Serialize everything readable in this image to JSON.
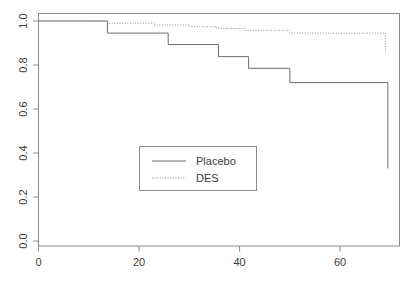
{
  "chart_data": {
    "type": "line",
    "subtype": "kaplan-meier-step",
    "title": "",
    "subtitle": "",
    "xlabel": "",
    "ylabel": "",
    "xlim": [
      0,
      72
    ],
    "ylim": [
      0.0,
      1.05
    ],
    "x_ticks": [
      0,
      20,
      40,
      60
    ],
    "x_tick_labels": [
      "0",
      "20",
      "40",
      "60"
    ],
    "y_ticks": [
      0.0,
      0.2,
      0.4,
      0.6,
      0.8,
      1.0
    ],
    "y_tick_labels": [
      "0.0",
      "0.2",
      "0.4",
      "0.6",
      "0.8",
      "1.0"
    ],
    "grid": false,
    "legend_position": "center",
    "legend_entries": [
      {
        "label": "Placebo",
        "linestyle": "solid",
        "color": "#6e6e6e"
      },
      {
        "label": "DES",
        "linestyle": "dotted",
        "color": "#8f8f8f"
      }
    ],
    "series": [
      {
        "name": "Placebo",
        "linestyle": "solid",
        "color": "#6e6e6e",
        "x": [
          0,
          13.7,
          13.7,
          25.8,
          25.8,
          35.8,
          35.8,
          41.8,
          41.8,
          50.0,
          50.0,
          69.5,
          69.5
        ],
        "y": [
          1.0,
          1.0,
          0.945,
          0.945,
          0.893,
          0.893,
          0.838,
          0.838,
          0.785,
          0.785,
          0.72,
          0.72,
          0.33
        ]
      },
      {
        "name": "DES",
        "linestyle": "dotted",
        "color": "#8f8f8f",
        "x": [
          0,
          13.7,
          13.7,
          23.0,
          23.0,
          30.0,
          30.0,
          35.5,
          35.5,
          41.0,
          41.0,
          50.0,
          50.0,
          69.0,
          69.0
        ],
        "y": [
          1.0,
          1.0,
          0.99,
          0.99,
          0.982,
          0.982,
          0.974,
          0.974,
          0.966,
          0.966,
          0.958,
          0.958,
          0.945,
          0.945,
          0.86
        ]
      }
    ]
  },
  "axes": {
    "x_axis_name": "x-axis",
    "y_axis_name": "y-axis"
  },
  "legend": {
    "items": [
      {
        "label": "Placebo"
      },
      {
        "label": "DES"
      }
    ]
  }
}
